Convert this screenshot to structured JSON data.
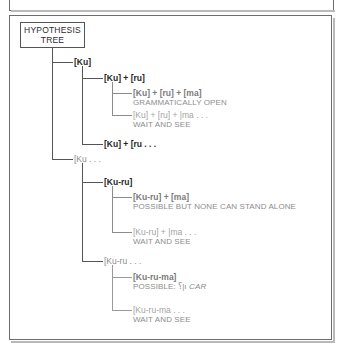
{
  "figure": {
    "root_label_line1": "HYPOTHESIS",
    "root_label_line2": "TREE"
  },
  "nodes": {
    "ku": {
      "label": "[Ku]"
    },
    "ku_ru": {
      "label": "[Ku] + [ru]"
    },
    "ku_ru_ma": {
      "label": "[Ku] + [ru] + [ma]",
      "status": "GRAMMATICALLY OPEN"
    },
    "ku_ru_ma_open": {
      "label": "[Ku] + [ru] + |ma . . .",
      "status": "WAIT AND SEE"
    },
    "ku_ru_open": {
      "label": "[Ku] + [ru . . ."
    },
    "ku_open": {
      "label": "[Ku . . ."
    },
    "kuru": {
      "label": "[Ku-ru]"
    },
    "kuru_ma": {
      "label": "[Ku-ru] + [ma]",
      "status": "POSSIBLE BUT NONE CAN STAND ALONE"
    },
    "kuru_ma_open": {
      "label": "[Ku-ru] + |ma . . .",
      "status": "WAIT AND SEE"
    },
    "kuru_open": {
      "label": "[Ku-ru . . ."
    },
    "kuruma": {
      "label": "[Ku-ru-ma]",
      "status_prefix": "POSSIBLE:",
      "status_mark": "⸮|ı",
      "status_word": "CAR"
    },
    "kuruma_open": {
      "label": "[Ku-ru-ma . . .",
      "status": "WAIT AND SEE"
    }
  },
  "colors": {
    "frame": "#6d6d6d",
    "line_dark": "#555555",
    "line_mid": "#8c8c8c",
    "line_light": "#9a9a9a",
    "text_dark": "#1f1f1f",
    "text_gray": "#8d8d8d",
    "text_faded": "#a2a2a2"
  }
}
